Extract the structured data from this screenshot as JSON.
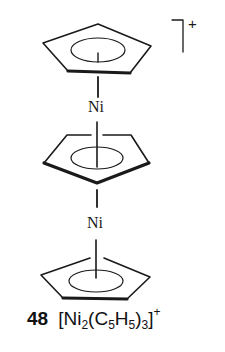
{
  "figure": {
    "compound_number": "48",
    "formula": {
      "open_bracket": "[",
      "metal": "Ni",
      "metal_count": "2",
      "ligand_open": "(",
      "carbon": "C",
      "carbon_count": "5",
      "hydrogen": "H",
      "hydrogen_count": "5",
      "ligand_close": ")",
      "ligand_count": "3",
      "close_bracket": "]",
      "charge": "+"
    },
    "structure": {
      "atoms": [
        {
          "label": "Ni",
          "position": "upper"
        },
        {
          "label": "Ni",
          "position": "lower"
        }
      ],
      "rings": [
        {
          "name": "top-cyclopentadienyl-ring",
          "type": "C5H5"
        },
        {
          "name": "middle-bridging-cyclopentadienyl-ring",
          "type": "C5H5"
        },
        {
          "name": "bottom-cyclopentadienyl-ring",
          "type": "C5H5"
        }
      ],
      "overall_charge": "+",
      "colors": {
        "ink": "#1a1a1a",
        "background": "#ffffff"
      }
    }
  }
}
